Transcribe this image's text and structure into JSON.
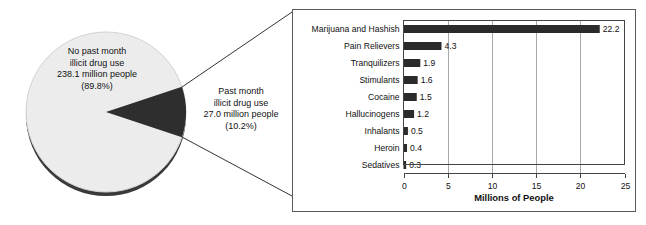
{
  "chart_data": [
    {
      "type": "pie",
      "title": "",
      "slices": [
        {
          "label": "No past month illicit drug use",
          "people_text": "238.1 million people",
          "percent_text": "(89.8%)",
          "value": 238.1,
          "percent": 89.8,
          "color": "#ececed"
        },
        {
          "label": "Past month illicit drug use",
          "people_text": "27.0 million people",
          "percent_text": "(10.2%)",
          "value": 27.0,
          "percent": 10.2,
          "color": "#2e2e2e"
        }
      ]
    },
    {
      "type": "bar",
      "orientation": "horizontal",
      "title": "",
      "xlabel": "Millions of People",
      "ylabel": "",
      "xlim": [
        0,
        25
      ],
      "xticks": [
        "0",
        "5",
        "10",
        "15",
        "20",
        "25"
      ],
      "grid": true,
      "legend": "none",
      "categories": [
        "Marijuana and Hashish",
        "Pain Relievers",
        "Tranquilizers",
        "Stimulants",
        "Cocaine",
        "Hallucinogens",
        "Inhalants",
        "Heroin",
        "Sedatives"
      ],
      "values": [
        22.2,
        4.3,
        1.9,
        1.6,
        1.5,
        1.2,
        0.5,
        0.4,
        0.3
      ],
      "value_labels": [
        "22.2",
        "4.3",
        "1.9",
        "1.6",
        "1.5",
        "1.2",
        "0.5",
        "0.4",
        "0.3"
      ],
      "bar_color": "#2b2b2b"
    }
  ],
  "pie": {
    "major": {
      "line1": "No past month",
      "line2": "illicit drug use",
      "line3": "238.1 million people",
      "line4": "(89.8%)"
    },
    "minor": {
      "line1": "Past month",
      "line2": "illicit drug use",
      "line3": "27.0 million people",
      "line4": "(10.2%)"
    }
  },
  "bars": {
    "axis_title": "Millions of People",
    "ticks": [
      "0",
      "5",
      "10",
      "15",
      "20",
      "25"
    ],
    "rows": [
      {
        "label": "Marijuana and Hashish",
        "value": "22.2"
      },
      {
        "label": "Pain Relievers",
        "value": "4.3"
      },
      {
        "label": "Tranquilizers",
        "value": "1.9"
      },
      {
        "label": "Stimulants",
        "value": "1.6"
      },
      {
        "label": "Cocaine",
        "value": "1.5"
      },
      {
        "label": "Hallucinogens",
        "value": "1.2"
      },
      {
        "label": "Inhalants",
        "value": "0.5"
      },
      {
        "label": "Heroin",
        "value": "0.4"
      },
      {
        "label": "Sedatives",
        "value": "0.3"
      }
    ]
  },
  "colors": {
    "bar": "#2b2b2b",
    "pie_major": "#ececed",
    "pie_minor": "#2e2e2e",
    "frame": "#5b5b5b"
  }
}
